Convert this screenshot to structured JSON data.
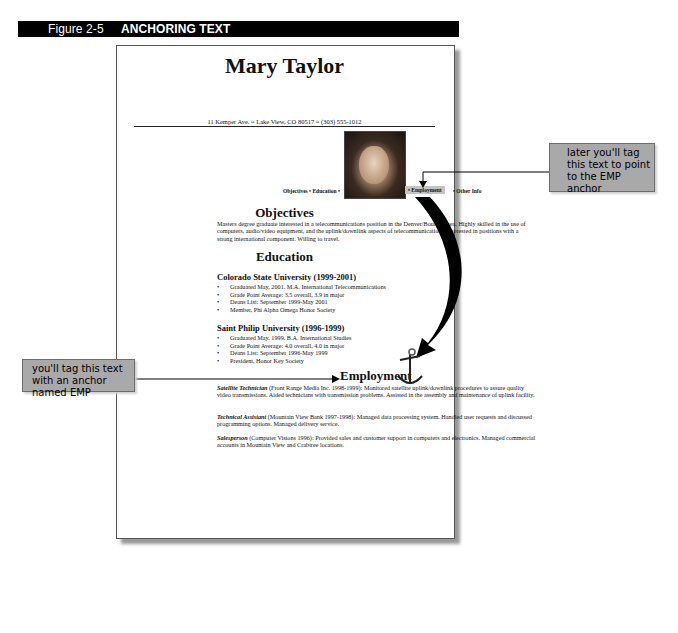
{
  "figure": {
    "number": "Figure 2-5",
    "title": "ANCHORING TEXT"
  },
  "resume": {
    "name": "Mary Taylor",
    "address": "11 Kemper Ave. ≈ Lake View, CO 80517 ≈ (303) 555-1012",
    "nav": {
      "left": "Objectives • Education •",
      "employment": "• Employment",
      "other": "• Other Info"
    },
    "objectives": {
      "heading": "Objectives",
      "text": "Masters degree graduate interested in a telecommunications position in the Denver/Boulder area. Highly skilled in the use of computers, audio/video equipment, and the uplink/downlink aspects of telecommunications. Interested in positions with a strong international component. Willing to travel."
    },
    "education": {
      "heading": "Education",
      "schools": [
        {
          "name": "Colorado State University (1999-2001)",
          "items": [
            "Graduated May, 2001. M.A. International Telecommunications",
            "Grade Point Average: 3.5 overall, 3.9 in major",
            "Deans List: September 1999-May 2001",
            "Member, Phi Alpha Omega Honor Society"
          ]
        },
        {
          "name": "Saint Philip University (1996-1999)",
          "items": [
            "Graduated May, 1999. B.A. International Studies",
            "Grade Point Average: 4.0 overall, 4.0 in major",
            "Deans List: September 1996-May 1999",
            "President, Honor Key Society"
          ]
        }
      ]
    },
    "employment": {
      "heading": "Employment",
      "jobs": [
        {
          "title": "Satellite Technician",
          "text": " (Front Range Media Inc. 1998-1999): Monitored satellite uplink/downlink procedures to assure quality video transmissions. Aided technicians with transmission problems. Assisted in the assembly and maintenance of uplink facility."
        },
        {
          "title": "Technical Assistant",
          "text": " (Mountain View Bank 1997-1998): Managed data processing system. Handled user requests and discussed programming options. Managed delivery service."
        },
        {
          "title": "Salesperson",
          "text": " (Computer Visions 1996): Provided sales and customer support in computers and electronics. Managed commercial accounts in Mountain View and Crabtree locations."
        }
      ]
    }
  },
  "callouts": {
    "right": "later you'll tag this text to point to the EMP anchor",
    "left": "you'll tag this text with an anchor named EMP"
  },
  "colors": {
    "caption_bar": "#000000",
    "callout_bg": "#a9a9a9",
    "arrow": "#000000"
  }
}
